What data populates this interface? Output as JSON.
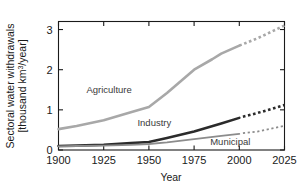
{
  "chart_data": {
    "type": "line",
    "title": "",
    "xlabel": "Year",
    "ylabel_line1": "Sectoral water withdrawals",
    "ylabel_line2": "[thousand km3/year]",
    "ylabel_unit_base": "[thousand km",
    "ylabel_unit_sup": "3",
    "ylabel_unit_tail": "/year]",
    "xlim": [
      1900,
      2025
    ],
    "ylim": [
      0,
      3.2
    ],
    "xticks": [
      1900,
      1925,
      1950,
      1975,
      2000,
      2025
    ],
    "xtick_labels": [
      "1900",
      "1925",
      "1950",
      "1975",
      "2000",
      "2025"
    ],
    "yticks": [
      0,
      1,
      2,
      3
    ],
    "ytick_labels": [
      "0",
      "1",
      "2",
      "3"
    ],
    "grid": false,
    "legend": "inline-annotations",
    "x": [
      1900,
      1910,
      1925,
      1940,
      1950,
      1960,
      1975,
      1990,
      2000,
      2010,
      2025
    ],
    "series": [
      {
        "name": "Agriculture",
        "color": "#a8a8a8",
        "width": 2.6,
        "label_x": 1928,
        "label_y": 1.42,
        "solid_end_year": 2000,
        "values": [
          0.52,
          0.6,
          0.74,
          0.94,
          1.07,
          1.42,
          2.0,
          2.4,
          2.6,
          2.78,
          3.1
        ],
        "solid_points": [
          [
            1900,
            0.52
          ],
          [
            1910,
            0.6
          ],
          [
            1925,
            0.74
          ],
          [
            1940,
            0.94
          ],
          [
            1950,
            1.07
          ],
          [
            1960,
            1.42
          ],
          [
            1975,
            2.0
          ],
          [
            1985,
            2.26
          ],
          [
            1990,
            2.4
          ],
          [
            2000,
            2.6
          ]
        ],
        "dashed_points": [
          [
            2000,
            2.6
          ],
          [
            2010,
            2.78
          ],
          [
            2025,
            3.1
          ]
        ]
      },
      {
        "name": "Industry",
        "color": "#2b2b2b",
        "width": 2.6,
        "label_x": 1953,
        "label_y": 0.6,
        "solid_end_year": 2000,
        "values": [
          0.1,
          0.11,
          0.13,
          0.17,
          0.2,
          0.3,
          0.46,
          0.66,
          0.8,
          0.92,
          1.12
        ],
        "solid_points": [
          [
            1900,
            0.1
          ],
          [
            1910,
            0.11
          ],
          [
            1925,
            0.13
          ],
          [
            1940,
            0.17
          ],
          [
            1950,
            0.2
          ],
          [
            1960,
            0.3
          ],
          [
            1975,
            0.46
          ],
          [
            1990,
            0.66
          ],
          [
            2000,
            0.8
          ]
        ],
        "dashed_points": [
          [
            2002,
            0.83
          ],
          [
            2010,
            0.92
          ],
          [
            2025,
            1.12
          ]
        ]
      },
      {
        "name": "Municipal",
        "color": "#8c8c8c",
        "width": 1.8,
        "label_x": 1995,
        "label_y": 0.12,
        "solid_end_year": 2000,
        "values": [
          0.09,
          0.1,
          0.11,
          0.13,
          0.15,
          0.19,
          0.27,
          0.35,
          0.4,
          0.46,
          0.6
        ],
        "solid_points": [
          [
            1900,
            0.09
          ],
          [
            1910,
            0.1
          ],
          [
            1925,
            0.11
          ],
          [
            1940,
            0.13
          ],
          [
            1950,
            0.15
          ],
          [
            1960,
            0.19
          ],
          [
            1975,
            0.27
          ],
          [
            1990,
            0.35
          ],
          [
            2000,
            0.4
          ]
        ],
        "dashed_points": [
          [
            2002,
            0.42
          ],
          [
            2010,
            0.46
          ],
          [
            2025,
            0.6
          ]
        ]
      }
    ],
    "annotations": [
      "Agriculture",
      "Industry",
      "Municipal"
    ],
    "axes_color": "#1a1a1a",
    "background": "#ffffff"
  }
}
